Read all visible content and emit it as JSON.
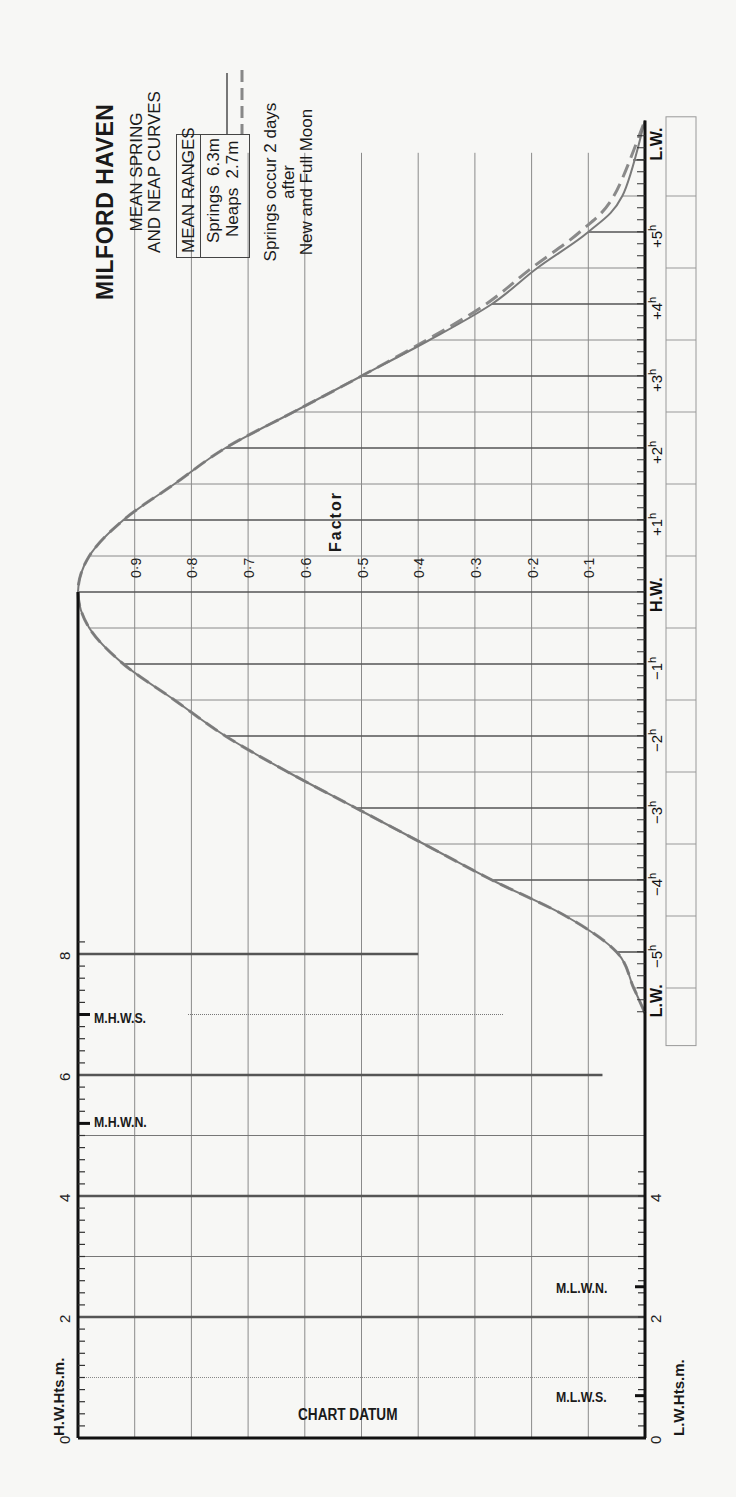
{
  "header": {
    "title": "MILFORD HAVEN",
    "subtitle_line1": "MEAN SPRING",
    "subtitle_line2": "AND NEAP CURVES",
    "ranges_heading": "MEAN RANGES",
    "springs_label": "Springs  6.3m",
    "neaps_label": "Neaps  2.7m",
    "note_line1": "Springs occur 2 days",
    "note_line2": "after",
    "note_line3": "New and Full Moon"
  },
  "axes": {
    "factor_label": "Factor",
    "hw_heights_label": "H.W.Hts.m.",
    "lw_heights_label": "L.W.Hts.m.",
    "chart_datum_label": "CHART DATUM",
    "mhws_label": "M.H.W.S.",
    "mhwn_label": "M.H.W.N.",
    "mlwn_label": "M.L.W.N.",
    "mlws_label": "M.L.W.S.",
    "hw_label": "H.W.",
    "lw_label": "L.W."
  },
  "chart_data": {
    "type": "line",
    "xlabel": "Time relative to H.W. (hours)",
    "ylabel": "Factor",
    "ylim": [
      0,
      1
    ],
    "factor_ticks": [
      "0·1",
      "0·2",
      "0·3",
      "0·4",
      "0·5",
      "0·6",
      "0·7",
      "0·8",
      "0·9"
    ],
    "time_ticks": [
      "L.W.",
      "-5h",
      "-4h",
      "-3h",
      "-2h",
      "-1h",
      "H.W.",
      "+1h",
      "+2h",
      "+3h",
      "+4h",
      "+5h",
      "L.W."
    ],
    "legend": [
      {
        "name": "Springs",
        "style": "solid"
      },
      {
        "name": "Neaps",
        "style": "dashed"
      }
    ],
    "x": [
      -5.85,
      -5.5,
      -5,
      -4.5,
      -4,
      -3.5,
      -3,
      -2.5,
      -2,
      -1.5,
      -1,
      -0.5,
      0,
      0.5,
      1,
      1.5,
      2,
      2.5,
      3,
      3.5,
      4,
      4.5,
      5,
      5.5,
      6.55
    ],
    "series": [
      {
        "name": "Springs",
        "values": [
          0,
          0.02,
          0.05,
          0.14,
          0.27,
          0.39,
          0.51,
          0.63,
          0.74,
          0.83,
          0.92,
          0.98,
          1.0,
          0.98,
          0.92,
          0.83,
          0.74,
          0.62,
          0.5,
          0.38,
          0.27,
          0.19,
          0.1,
          0.04,
          0
        ]
      },
      {
        "name": "Neaps",
        "values": [
          0,
          0.02,
          0.05,
          0.14,
          0.27,
          0.39,
          0.51,
          0.63,
          0.74,
          0.83,
          0.92,
          0.98,
          1.0,
          0.98,
          0.92,
          0.83,
          0.74,
          0.62,
          0.5,
          0.385,
          0.28,
          0.2,
          0.115,
          0.055,
          0
        ]
      }
    ],
    "height_scale": {
      "hw_ticks": [
        "0",
        "2",
        "4",
        "6",
        "8"
      ],
      "lw_ticks": [
        "0",
        "2",
        "4"
      ],
      "MHWS": 7.0,
      "MHWN": 5.2,
      "MLWN": 2.5,
      "MLWS": 0.7
    },
    "mean_ranges": {
      "springs_m": 6.3,
      "neaps_m": 2.7
    },
    "grid": true
  }
}
